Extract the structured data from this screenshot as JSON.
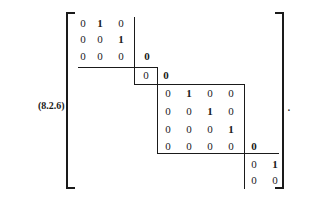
{
  "equation": {
    "label": "(8.2.6)",
    "terminator": ".",
    "blocks": [
      {
        "name": "block-1",
        "rows": [
          [
            "0",
            "1",
            "0"
          ],
          [
            "0",
            "0",
            "1"
          ],
          [
            "0",
            "0",
            "0"
          ]
        ],
        "bold": [
          [
            false,
            true,
            false
          ],
          [
            false,
            false,
            true
          ],
          [
            false,
            false,
            false
          ]
        ]
      },
      {
        "name": "block-2",
        "rows": [
          [
            "0"
          ]
        ],
        "bold": [
          [
            false
          ]
        ]
      },
      {
        "name": "block-3",
        "rows": [
          [
            "0",
            "1",
            "0",
            "0"
          ],
          [
            "0",
            "0",
            "1",
            "0"
          ],
          [
            "0",
            "0",
            "0",
            "1"
          ],
          [
            "0",
            "0",
            "0",
            "0"
          ]
        ],
        "bold": [
          [
            false,
            true,
            false,
            false
          ],
          [
            false,
            false,
            true,
            false
          ],
          [
            false,
            false,
            false,
            true
          ],
          [
            false,
            false,
            false,
            false
          ]
        ]
      },
      {
        "name": "block-4",
        "rows": [
          [
            "0",
            "1"
          ],
          [
            "0",
            "0"
          ]
        ],
        "bold": [
          [
            false,
            true
          ],
          [
            false,
            false
          ]
        ]
      }
    ],
    "superdiagonal_zeros": [
      "0",
      "0",
      "0"
    ]
  }
}
